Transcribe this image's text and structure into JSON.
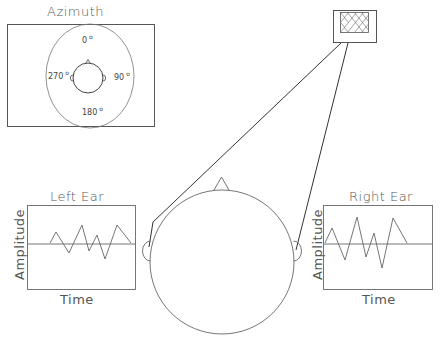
{
  "azimuth_panel": {
    "title": "Azimuth",
    "angles": [
      {
        "label": "0",
        "deg_symbol": "o"
      },
      {
        "label": "90",
        "deg_symbol": "o"
      },
      {
        "label": "180",
        "deg_symbol": "o"
      },
      {
        "label": "270",
        "deg_symbol": "o"
      }
    ]
  },
  "sound_source": {
    "icon": "crosshatch-speaker-icon"
  },
  "left_ear_chart": {
    "title": "Left Ear",
    "ylabel": "Amplitude",
    "xlabel": "Time"
  },
  "right_ear_chart": {
    "title": "Right Ear",
    "ylabel": "Amplitude",
    "xlabel": "Time"
  },
  "colors": {
    "line": "#555555",
    "text": "#555555",
    "background": "#ffffff"
  }
}
